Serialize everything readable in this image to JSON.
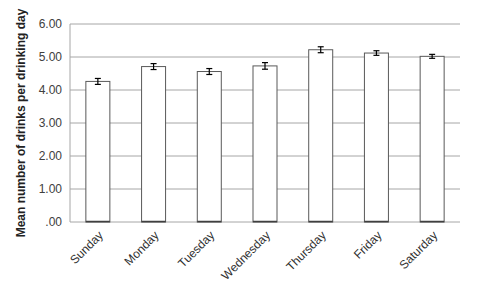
{
  "chart_data": {
    "type": "bar",
    "title": "",
    "xlabel": "",
    "ylabel": "Mean number of drinks per drinking day",
    "categories": [
      "Sunday",
      "Monday",
      "Tuesday",
      "Wednesday",
      "Thursday",
      "Friday",
      "Saturday"
    ],
    "values": [
      4.26,
      4.71,
      4.56,
      4.73,
      5.22,
      5.12,
      5.02
    ],
    "error": [
      0.09,
      0.09,
      0.09,
      0.1,
      0.09,
      0.07,
      0.06
    ],
    "ylim": [
      0,
      6
    ],
    "yticks": [
      ".00",
      "1.00",
      "2.00",
      "3.00",
      "4.00",
      "5.00",
      "6.00"
    ],
    "grid": true,
    "legend": null,
    "colors": {
      "bar_fill": "#ffffff",
      "bar_stroke": "#595959",
      "grid": "#a6a6a6",
      "error": "#000000"
    }
  }
}
